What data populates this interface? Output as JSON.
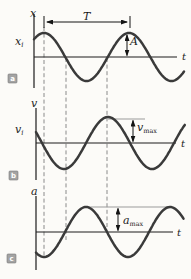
{
  "colors": {
    "background": "#fcfbf8",
    "curve": "#3a3a3a",
    "axis": "#1c1c1c",
    "dashed_guide": "#8a8a8a",
    "reference_line": "#9b9b9b",
    "panel_box_bg": "#a3a3a3",
    "panel_box_text": "#ffffff"
  },
  "dashed_lines": [
    {
      "x": 44,
      "y1": 27,
      "y2": 256
    },
    {
      "x": 66,
      "y1": 58,
      "y2": 240
    },
    {
      "x": 107,
      "y1": 58,
      "y2": 231
    }
  ],
  "panels": [
    {
      "tag": "a",
      "axis_label": {
        "text": "x",
        "x": 30,
        "y": 17
      },
      "t_label": {
        "text": "t",
        "x": 182,
        "y": 60
      },
      "init_label": {
        "base": "x",
        "sub": "i",
        "x": 15,
        "y": 45
      },
      "y_axis": {
        "x1": 34,
        "y1": 14,
        "x2": 34,
        "y2": 88
      },
      "t_axis": {
        "x1": 34,
        "y1": 57,
        "x2": 177,
        "y2": 57
      },
      "curve": {
        "axis_y": 57,
        "max_x": 44,
        "period": 85,
        "amplitude": 24,
        "x_start": 34,
        "x_end": 184
      },
      "period_marker": {
        "label": {
          "text": "T",
          "x": 83,
          "y": 20
        },
        "half1": {
          "x1": 86,
          "y1": 22,
          "x2": 47,
          "y2": 22
        },
        "half2": {
          "x1": 86,
          "y1": 22,
          "x2": 127,
          "y2": 22
        },
        "tick_left": {
          "x1": 44,
          "y1": 16,
          "x2": 44,
          "y2": 28
        },
        "tick_right": {
          "x1": 130,
          "y1": 16,
          "x2": 130,
          "y2": 28
        }
      },
      "amp_marker": {
        "label": {
          "text": "A",
          "x": 130,
          "y": 45
        },
        "half1": {
          "x1": 127,
          "y1": 44,
          "x2": 127,
          "y2": 35
        },
        "half2": {
          "x1": 127,
          "y1": 44,
          "x2": 127,
          "y2": 55.5
        }
      },
      "box": {
        "label": "a",
        "rect": {
          "x": 8,
          "y": 74
        },
        "text": {
          "x": 12.5,
          "y": 81
        }
      }
    },
    {
      "tag": "b",
      "axis_label": {
        "text": "v",
        "x": 31,
        "y": 107
      },
      "t_label": {
        "text": "t",
        "x": 181,
        "y": 147
      },
      "init_label": {
        "base": "v",
        "sub": "i",
        "x": 15,
        "y": 133
      },
      "y_axis": {
        "x1": 36,
        "y1": 108,
        "x2": 36,
        "y2": 180
      },
      "t_axis": {
        "x1": 36,
        "y1": 143,
        "x2": 176,
        "y2": 143
      },
      "curve": {
        "axis_y": 143,
        "max_x": 108,
        "period": 88,
        "amplitude": 26,
        "x_start": 36,
        "x_end": 185
      },
      "ref_line": {
        "x1": 108,
        "y1": 119,
        "x2": 145,
        "y2": 119
      },
      "max_marker": {
        "label": {
          "base": "v",
          "sub": "max",
          "x": 137,
          "y": 131
        },
        "half1": {
          "x1": 133,
          "y1": 130,
          "x2": 133,
          "y2": 120.5
        },
        "half2": {
          "x1": 133,
          "y1": 130,
          "x2": 133,
          "y2": 141.5
        }
      },
      "box": {
        "label": "b",
        "rect": {
          "x": 9,
          "y": 171
        },
        "text": {
          "x": 13.5,
          "y": 178
        }
      }
    },
    {
      "tag": "c",
      "axis_label": {
        "text": "a",
        "x": 31,
        "y": 195
      },
      "t_label": {
        "text": "t",
        "x": 177,
        "y": 236
      },
      "y_axis": {
        "x1": 36,
        "y1": 196,
        "x2": 36,
        "y2": 270
      },
      "t_axis": {
        "x1": 36,
        "y1": 232,
        "x2": 173,
        "y2": 232
      },
      "curve": {
        "axis_y": 232,
        "max_x": 86,
        "period": 84,
        "amplitude": 25,
        "x_start": 36,
        "x_end": 184
      },
      "ref_line": {
        "x1": 88,
        "y1": 207,
        "x2": 170,
        "y2": 207
      },
      "max_marker": {
        "label": {
          "base": "a",
          "sub": "max",
          "x": 123,
          "y": 224
        },
        "half1": {
          "x1": 118,
          "y1": 219,
          "x2": 118,
          "y2": 208.5
        },
        "half2": {
          "x1": 118,
          "y1": 219,
          "x2": 118,
          "y2": 230.5
        }
      },
      "box": {
        "label": "c",
        "rect": {
          "x": 7,
          "y": 254
        },
        "text": {
          "x": 11.5,
          "y": 261
        }
      }
    }
  ]
}
